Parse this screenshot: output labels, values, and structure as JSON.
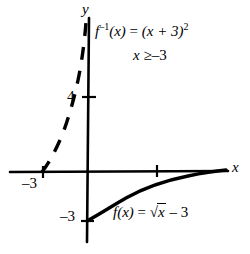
{
  "figure": {
    "kind": "cartesian-graph",
    "background_color": "#ffffff",
    "ink_color": "#000000",
    "axes": {
      "x_axis_label": "x",
      "y_axis_label": "y",
      "origin_px": {
        "x": 88,
        "y": 172
      }
    },
    "tick_labels": {
      "y_four": "4",
      "x_minus_three": "–3",
      "y_minus_three": "–3"
    },
    "annotations": {
      "inverse_equation": {
        "fn_name": "f",
        "inverse_exponent": "–1",
        "arg": "(x)",
        "equals": "=",
        "body": "(x + 3)",
        "power": "2",
        "plain": "f⁻¹(x) = (x + 3)²"
      },
      "domain_restriction": {
        "variable": "x",
        "relation": "≥",
        "value": "–3",
        "plain": "x ≥ –3"
      },
      "function_equation": {
        "fn_name": "f",
        "arg": "(x)",
        "equals": "=",
        "radical_sign": "√",
        "radicand": "x",
        "minus": "– 3",
        "plain": "f(x) = √x – 3"
      }
    },
    "curves": {
      "solid_sqrt": {
        "style": "solid",
        "label": "f(x) = √x – 3",
        "start_point": "(0, –3)"
      },
      "dashed_parabola": {
        "style": "dashed",
        "label": "f⁻¹(x) = (x + 3)²",
        "start_point": "(–3, 0)"
      }
    }
  }
}
